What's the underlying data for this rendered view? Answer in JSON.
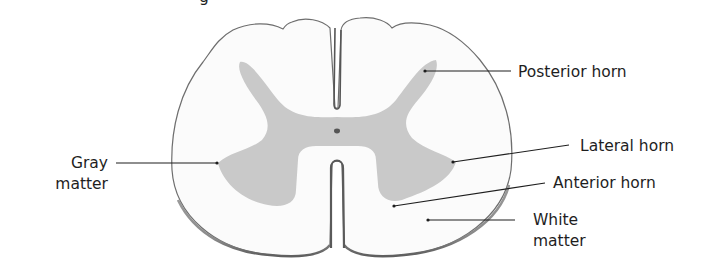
{
  "title_fragment": "g",
  "colors": {
    "background": "#ffffff",
    "white_matter": "#fbfbfb",
    "gray_matter": "#c9c9c9",
    "outline": "#6e6e6e",
    "text": "#1e1e1e"
  },
  "labels": {
    "posterior_horn": "Posterior horn",
    "gray_matter_line1": "Gray",
    "gray_matter_line2": "matter",
    "lateral_horn": "Lateral horn",
    "anterior_horn": "Anterior horn",
    "white_matter_line1": "White",
    "white_matter_line2": "matter"
  }
}
